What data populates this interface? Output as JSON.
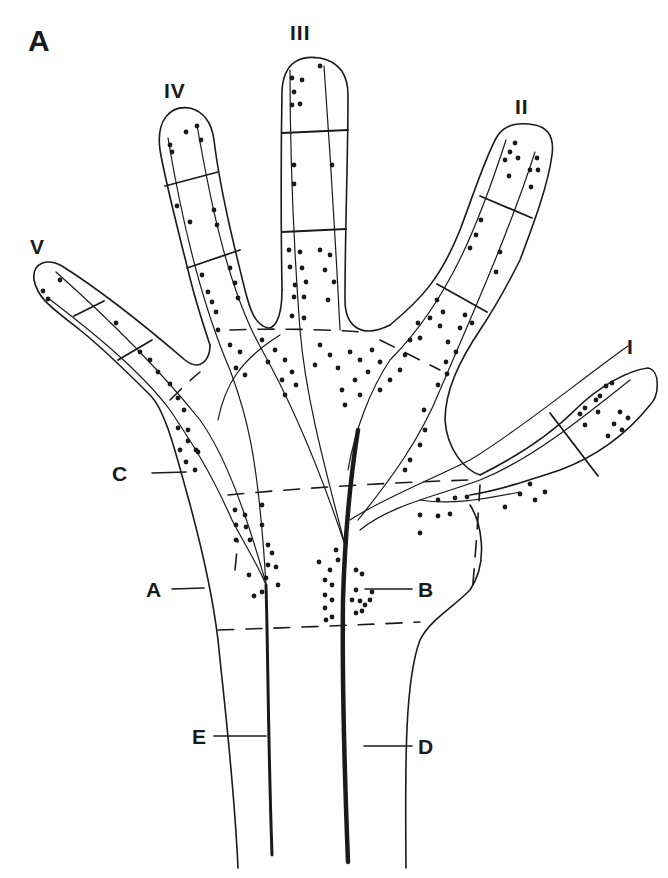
{
  "figure": {
    "panel_label": "A",
    "fingers": [
      {
        "id": "V",
        "label": "V"
      },
      {
        "id": "IV",
        "label": "IV"
      },
      {
        "id": "III",
        "label": "III"
      },
      {
        "id": "II",
        "label": "II"
      },
      {
        "id": "I",
        "label": "I"
      }
    ],
    "regions": [
      {
        "id": "A",
        "label": "A"
      },
      {
        "id": "B",
        "label": "B"
      },
      {
        "id": "C",
        "label": "C"
      },
      {
        "id": "D",
        "label": "D"
      },
      {
        "id": "E",
        "label": "E"
      }
    ],
    "colors": {
      "ink": "#1a1a1a",
      "background": "#ffffff"
    }
  }
}
